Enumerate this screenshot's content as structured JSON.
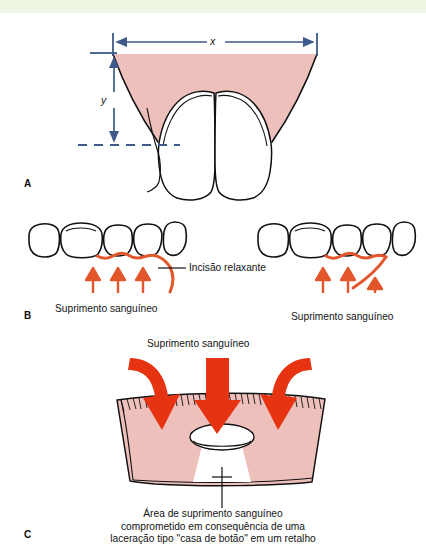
{
  "figure": {
    "background_color": "#ffffff",
    "top_band_color": "#eef6e3"
  },
  "colors": {
    "tissue_pink": "#eec0bc",
    "arrow_red": "#e63312",
    "incision_orange": "#e2562c",
    "dimension_blue": "#3d5a8a",
    "outline_black": "#111111",
    "text_black": "#141414"
  },
  "panels": [
    {
      "letter": "A",
      "name": "flap-base-width-diagram",
      "dimensions": [
        {
          "id": "x",
          "label": "x",
          "orientation": "horizontal",
          "meaning": "largura da base do retalho"
        },
        {
          "id": "y",
          "label": "y",
          "orientation": "vertical",
          "meaning": "altura do retalho"
        }
      ],
      "teeth_count": 2
    },
    {
      "letter": "B",
      "name": "relaxing-incision-diagram",
      "groups": [
        {
          "id": "left",
          "teeth_count": 5,
          "arrow_count": 3,
          "labels": {
            "incision": "Incisão relaxante",
            "blood_supply": "Suprimento sanguíneo"
          }
        },
        {
          "id": "right",
          "teeth_count": 5,
          "arrow_count": 3,
          "labels": {
            "blood_supply": "Suprimento sanguíneo"
          }
        }
      ]
    },
    {
      "letter": "C",
      "name": "buttonhole-laceration-diagram",
      "top_label": "Suprimento sanguíneo",
      "arrow_count": 3,
      "caption_lines": [
        "Área de suprimento sanguíneo",
        "comprometido em consequência de uma",
        "laceração tipo \"casa de botão\" em um retalho"
      ]
    }
  ]
}
